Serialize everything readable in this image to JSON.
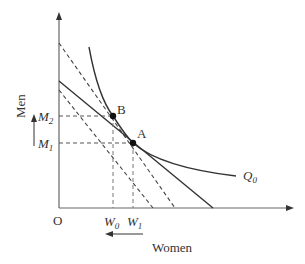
{
  "diagram": {
    "title": "",
    "axes": {
      "y_label": "Men",
      "x_label": "Women",
      "origin_label": "O"
    },
    "points": [
      {
        "id": "B",
        "label": "B"
      },
      {
        "id": "A",
        "label": "A"
      }
    ],
    "levels": {
      "m2": {
        "base": "M",
        "sub": "2"
      },
      "m1": {
        "base": "M",
        "sub": "1"
      },
      "w0": {
        "base": "W",
        "sub": "0"
      },
      "w1": {
        "base": "W",
        "sub": "1"
      }
    },
    "isoquant": {
      "base": "Q",
      "sub": "0"
    },
    "annotations": {
      "men_arrow": "up",
      "women_arrow": "left"
    },
    "colors": {
      "line": "#333333",
      "axis": "#555555",
      "dashed": "#555555"
    }
  }
}
